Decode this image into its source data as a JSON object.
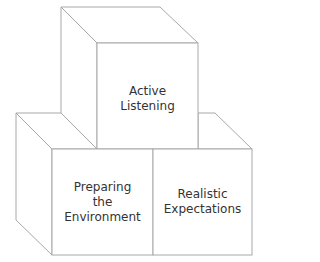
{
  "diagram": {
    "type": "stacked-cubes",
    "line_color": "#a8a8a8",
    "text_color": "#333333",
    "blocks": [
      {
        "position": "top",
        "label_lines": [
          "Active",
          "Listening"
        ]
      },
      {
        "position": "bottom-left",
        "label_lines": [
          "Preparing",
          "the",
          "Environment"
        ]
      },
      {
        "position": "bottom-right",
        "label_lines": [
          "Realistic",
          "Expectations"
        ]
      }
    ]
  }
}
